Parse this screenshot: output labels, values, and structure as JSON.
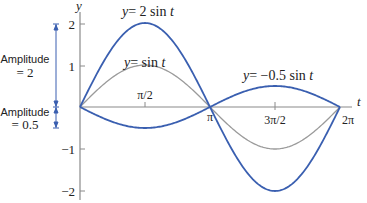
{
  "chart_data": {
    "type": "line",
    "title": "",
    "xlabel": "t",
    "ylabel": "y",
    "xlim": [
      0,
      6.2832
    ],
    "ylim": [
      -2,
      2
    ],
    "grid": false,
    "x_ticks": [
      {
        "value": 1.5708,
        "label": "π/2"
      },
      {
        "value": 3.1416,
        "label": "π"
      },
      {
        "value": 4.7124,
        "label": "3π/2"
      },
      {
        "value": 6.2832,
        "label": "2π"
      }
    ],
    "y_ticks": [
      {
        "value": 2,
        "label": "2"
      },
      {
        "value": 1,
        "label": "1"
      },
      {
        "value": -1,
        "label": "−1"
      },
      {
        "value": -2,
        "label": "−2"
      }
    ],
    "series": [
      {
        "name": "y = 2 sin t",
        "amplitude": 2,
        "color": "#3a5fb0",
        "x": [
          0,
          1.5708,
          3.1416,
          4.7124,
          6.2832
        ],
        "values": [
          0,
          2,
          0,
          -2,
          0
        ]
      },
      {
        "name": "y = sin t",
        "amplitude": 1,
        "color": "#9a9a9a",
        "x": [
          0,
          1.5708,
          3.1416,
          4.7124,
          6.2832
        ],
        "values": [
          0,
          1,
          0,
          -1,
          0
        ]
      },
      {
        "name": "y = −0.5 sin t",
        "amplitude": -0.5,
        "color": "#3a5fb0",
        "x": [
          0,
          1.5708,
          3.1416,
          4.7124,
          6.2832
        ],
        "values": [
          0,
          -0.5,
          0,
          0.5,
          0
        ]
      }
    ],
    "annotations": [
      {
        "text": "y = 2 sin t",
        "lhs": "y",
        "rhs": "= 2 sin ",
        "var": "t"
      },
      {
        "text": "y = sin t",
        "lhs": "y",
        "rhs": "= sin ",
        "var": "t"
      },
      {
        "text": "y = −0.5 sin t",
        "lhs": "y",
        "rhs": "= −0.5 sin ",
        "var": "t"
      },
      {
        "text": "Amplitude = 2",
        "line1": "Amplitude",
        "line2": "= 2"
      },
      {
        "text": "Amplitude = 0.5",
        "line1": "Amplitude",
        "line2": "= 0.5"
      }
    ]
  },
  "colors": {
    "blue": "#3a5fb0",
    "gray": "#9a9a9a",
    "axis": "#8a8a8a",
    "text": "#222222"
  }
}
